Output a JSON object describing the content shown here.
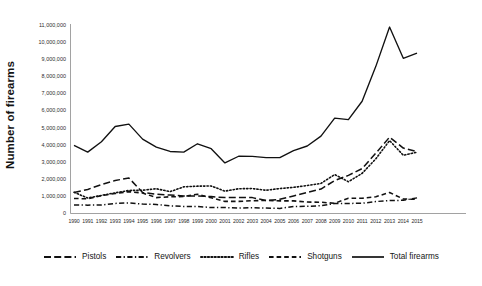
{
  "chart_data": {
    "type": "line",
    "title": "",
    "subtitle": "",
    "xlabel": "",
    "ylabel": "Number of firearms",
    "grid": false,
    "legend_position": "bottom",
    "xlim": [
      1990,
      2015
    ],
    "ylim": [
      0,
      11000000
    ],
    "ytick_step": 1000000,
    "categories": [
      1990,
      1991,
      1992,
      1993,
      1994,
      1995,
      1996,
      1997,
      1998,
      1999,
      2000,
      2001,
      2002,
      2003,
      2004,
      2005,
      2006,
      2007,
      2008,
      2009,
      2010,
      2011,
      2012,
      2013,
      2014,
      2015
    ],
    "ytick_labels": [
      "0",
      "1,000,000",
      "2,000,000",
      "3,000,000",
      "4,000,000",
      "5,000,000",
      "6,000,000",
      "7,000,000",
      "8,000,000",
      "9,000,000",
      "10,000,000",
      "11,000,000"
    ],
    "xtick_labels": [
      "1990",
      "1991",
      "1992",
      "1993",
      "1994",
      "1995",
      "1996",
      "1997",
      "1998",
      "1999",
      "2000",
      "2001",
      "2002",
      "2003",
      "2004",
      "2005",
      "2006",
      "2007",
      "2008",
      "2009",
      "2010",
      "2011",
      "2012",
      "2013",
      "2014",
      "2015"
    ],
    "series": [
      {
        "name": "Pistols",
        "style": "long-dash",
        "color": "#111111",
        "values": [
          1200000,
          1380000,
          1660000,
          1900000,
          2050000,
          1200000,
          1100000,
          1050000,
          1000000,
          1000000,
          960000,
          900000,
          900000,
          900000,
          730000,
          800000,
          1000000,
          1200000,
          1400000,
          1900000,
          2200000,
          2600000,
          3500000,
          4440000,
          3800000,
          3600000
        ]
      },
      {
        "name": "Revolvers",
        "style": "dash-dot",
        "color": "#111111",
        "values": [
          470000,
          460000,
          470000,
          560000,
          590000,
          520000,
          500000,
          420000,
          380000,
          380000,
          320000,
          320000,
          290000,
          310000,
          290000,
          270000,
          385000,
          390000,
          430000,
          550000,
          560000,
          570000,
          670000,
          725000,
          745000,
          885000
        ]
      },
      {
        "name": "Rifles",
        "style": "dotted",
        "color": "#111111",
        "values": [
          1210000,
          880000,
          1030000,
          1180000,
          1320000,
          1330000,
          1420000,
          1250000,
          1530000,
          1570000,
          1580000,
          1280000,
          1420000,
          1430000,
          1330000,
          1430000,
          1500000,
          1610000,
          1730000,
          2250000,
          1830000,
          2320000,
          3170000,
          4240000,
          3380000,
          3560000
        ]
      },
      {
        "name": "Shotguns",
        "style": "dash",
        "color": "#111111",
        "values": [
          850000,
          830000,
          1020000,
          1140000,
          1250000,
          1170000,
          900000,
          950000,
          960000,
          1100000,
          890000,
          680000,
          680000,
          720000,
          730000,
          710000,
          710000,
          640000,
          630000,
          570000,
          860000,
          860000,
          950000,
          1200000,
          820000,
          800000
        ]
      },
      {
        "name": "Total firearms",
        "style": "solid",
        "color": "#111111",
        "values": [
          3960000,
          3560000,
          4170000,
          5060000,
          5200000,
          4320000,
          3850000,
          3600000,
          3560000,
          4050000,
          3760000,
          2930000,
          3320000,
          3310000,
          3240000,
          3240000,
          3650000,
          3920000,
          4500000,
          5550000,
          5460000,
          6540000,
          8580000,
          10880000,
          9050000,
          9360000
        ]
      }
    ]
  }
}
